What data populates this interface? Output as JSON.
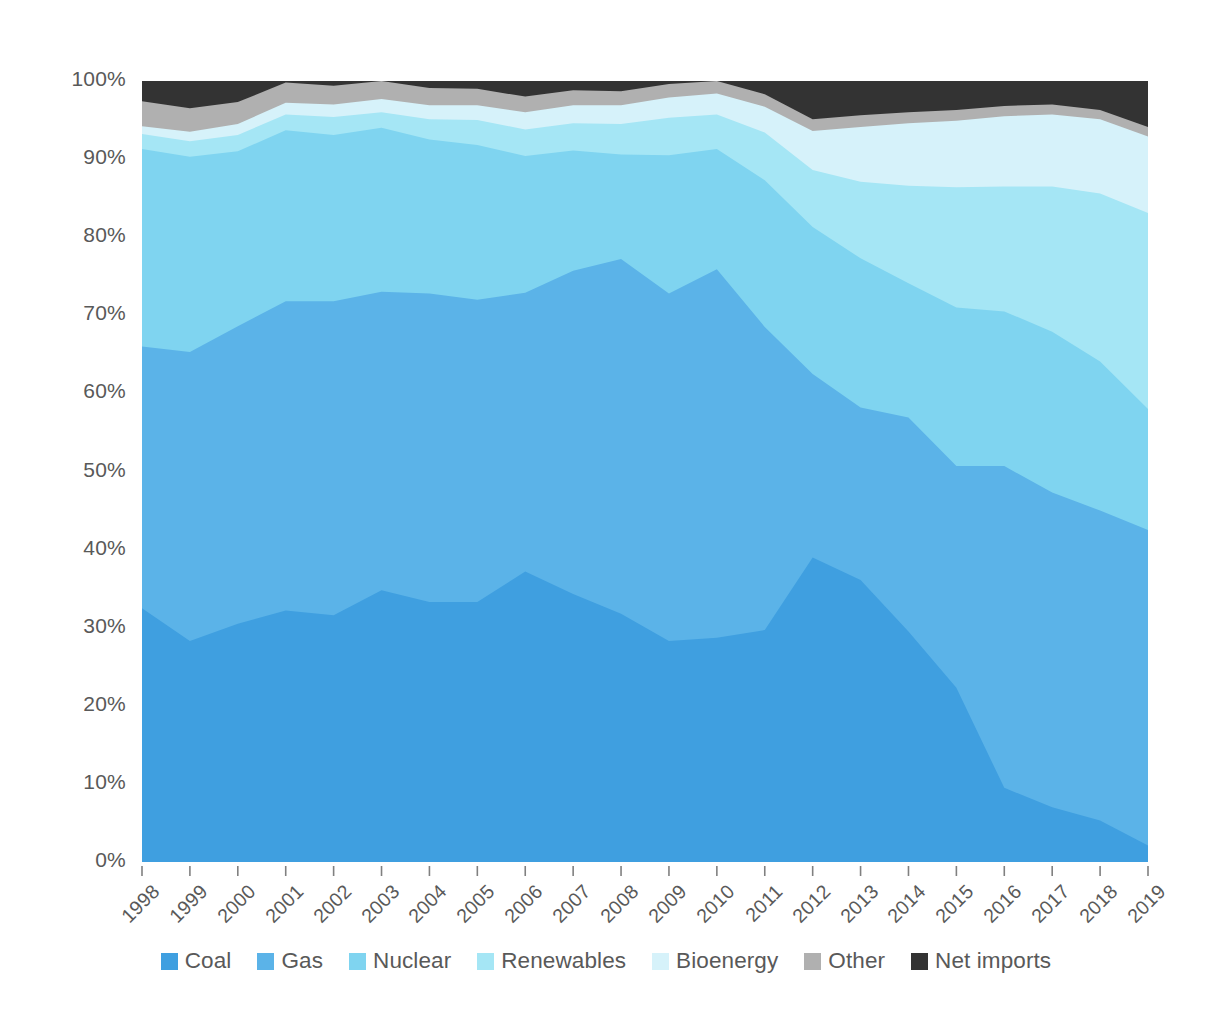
{
  "chart_data": {
    "type": "area",
    "stacked": true,
    "normalized_percent": true,
    "title": "",
    "subtitle": "",
    "xlabel": "",
    "ylabel": "",
    "grid": false,
    "legend_position": "bottom",
    "ylim": [
      0,
      100
    ],
    "y_ticks": [
      "0%",
      "10%",
      "20%",
      "30%",
      "40%",
      "50%",
      "60%",
      "70%",
      "80%",
      "90%",
      "100%"
    ],
    "y_tick_values": [
      0,
      10,
      20,
      30,
      40,
      50,
      60,
      70,
      80,
      90,
      100
    ],
    "categories": [
      "1998",
      "1999",
      "2000",
      "2001",
      "2002",
      "2003",
      "2004",
      "2005",
      "2006",
      "2007",
      "2008",
      "2009",
      "2010",
      "2011",
      "2012",
      "2013",
      "2014",
      "2015",
      "2016",
      "2017",
      "2018",
      "2019"
    ],
    "x": [
      1998,
      1999,
      2000,
      2001,
      2002,
      2003,
      2004,
      2005,
      2006,
      2007,
      2008,
      2009,
      2010,
      2011,
      2012,
      2013,
      2014,
      2015,
      2016,
      2017,
      2018,
      2019
    ],
    "series": [
      {
        "name": "Coal",
        "color": "#3F9FE0",
        "values": [
          32.5,
          28.3,
          30.5,
          32.2,
          31.6,
          34.8,
          33.3,
          33.3,
          37.2,
          34.3,
          31.8,
          28.3,
          28.7,
          29.7,
          39.0,
          36.1,
          29.5,
          22.3,
          9.5,
          7.0,
          5.3,
          2.1
        ]
      },
      {
        "name": "Gas",
        "color": "#5BB3E8",
        "values": [
          33.5,
          37.0,
          38.1,
          39.6,
          40.2,
          38.2,
          39.5,
          38.7,
          35.7,
          41.4,
          45.4,
          44.5,
          47.2,
          38.8,
          23.5,
          22.1,
          27.4,
          28.4,
          41.2,
          40.3,
          39.7,
          40.4
        ]
      },
      {
        "name": "Nuclear",
        "color": "#7FD4F0",
        "values": [
          25.3,
          25.0,
          22.4,
          21.9,
          21.3,
          21.0,
          19.7,
          19.8,
          17.5,
          15.4,
          13.4,
          17.7,
          15.4,
          18.8,
          18.8,
          19.1,
          17.2,
          20.3,
          19.8,
          20.6,
          19.1,
          15.5
        ]
      },
      {
        "name": "Renewables",
        "color": "#A5E6F5",
        "values": [
          1.9,
          2.0,
          2.1,
          2.0,
          2.3,
          2.0,
          2.6,
          3.2,
          3.4,
          3.5,
          3.9,
          4.8,
          4.4,
          6.1,
          7.3,
          9.8,
          12.5,
          15.4,
          16.0,
          18.6,
          21.5,
          25.1
        ]
      },
      {
        "name": "Bioenergy",
        "color": "#D6F2FA",
        "values": [
          1.0,
          1.2,
          1.4,
          1.5,
          1.6,
          1.7,
          1.8,
          1.9,
          2.2,
          2.3,
          2.4,
          2.6,
          2.7,
          3.3,
          5.0,
          7.0,
          8.0,
          8.5,
          9.0,
          9.2,
          9.5,
          9.8
        ]
      },
      {
        "name": "Other",
        "color": "#B0B0B0",
        "values": [
          3.2,
          3.0,
          2.8,
          2.6,
          2.4,
          2.3,
          2.2,
          2.1,
          2.0,
          1.9,
          1.8,
          1.7,
          1.6,
          1.6,
          1.5,
          1.5,
          1.4,
          1.4,
          1.3,
          1.3,
          1.2,
          1.2
        ]
      },
      {
        "name": "Net imports",
        "color": "#333333",
        "values": [
          2.6,
          3.5,
          2.7,
          0.2,
          0.6,
          0.0,
          0.9,
          1.0,
          2.0,
          1.2,
          1.3,
          0.4,
          0.0,
          1.7,
          4.9,
          4.4,
          4.0,
          3.7,
          3.2,
          3.0,
          3.7,
          5.9
        ]
      }
    ],
    "legend": [
      {
        "label": "Coal",
        "color": "#3F9FE0"
      },
      {
        "label": "Gas",
        "color": "#5BB3E8"
      },
      {
        "label": "Nuclear",
        "color": "#7FD4F0"
      },
      {
        "label": "Renewables",
        "color": "#A5E6F5"
      },
      {
        "label": "Bioenergy",
        "color": "#D6F2FA"
      },
      {
        "label": "Other",
        "color": "#B0B0B0"
      },
      {
        "label": "Net imports",
        "color": "#333333"
      }
    ]
  },
  "plot": {
    "left": 142,
    "right": 1148,
    "top": 81,
    "bottom": 862
  }
}
